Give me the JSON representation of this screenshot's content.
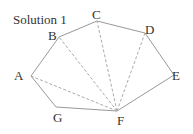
{
  "title": "Solution 1",
  "vertices": [
    {
      "id": "A",
      "x": 31,
      "y": 76,
      "lx": 14,
      "ly": 80
    },
    {
      "id": "B",
      "x": 59,
      "y": 37,
      "lx": 48,
      "ly": 40
    },
    {
      "id": "C",
      "x": 97,
      "y": 21,
      "lx": 92,
      "ly": 19
    },
    {
      "id": "D",
      "x": 145,
      "y": 33,
      "lx": 145,
      "ly": 34
    },
    {
      "id": "E",
      "x": 174,
      "y": 75,
      "lx": 172,
      "ly": 80
    },
    {
      "id": "F",
      "x": 117,
      "y": 111,
      "lx": 117,
      "ly": 125
    },
    {
      "id": "G",
      "x": 56,
      "y": 107,
      "lx": 53,
      "ly": 122
    }
  ],
  "polygon_order": [
    "A",
    "B",
    "C",
    "D",
    "E",
    "F",
    "G"
  ],
  "diagonals": [
    [
      "F",
      "A"
    ],
    [
      "F",
      "B"
    ],
    [
      "F",
      "C"
    ],
    [
      "F",
      "D"
    ]
  ],
  "colors": {
    "edge": "#999999",
    "diagonal": "#aaaaaa",
    "text": "#333333"
  }
}
